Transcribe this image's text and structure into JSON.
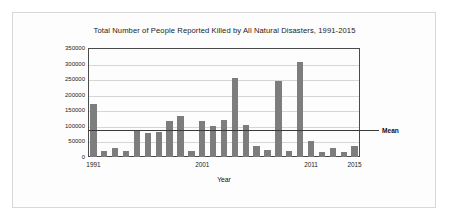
{
  "chart_data": {
    "type": "bar",
    "title": "Total Number of People Reported Killed by All Natural Disasters, 1991-2015",
    "xlabel": "Year",
    "ylabel": "Number of Deaths",
    "ylim": [
      0,
      350000
    ],
    "ytick_values": [
      0,
      50000,
      100000,
      150000,
      200000,
      250000,
      300000,
      350000
    ],
    "ytick_labels": [
      "0",
      "50000",
      "100000",
      "150000",
      "200000",
      "250000",
      "300000",
      "350000"
    ],
    "grid": true,
    "legend": "none",
    "xtick_labels": [
      "1991",
      "2001",
      "2011",
      "2015"
    ],
    "xtick_categories": [
      "1991",
      "2001",
      "2011",
      "2015"
    ],
    "categories": [
      "1991",
      "1992",
      "1993",
      "1994",
      "1995",
      "1996",
      "1997",
      "1998",
      "1999",
      "2000",
      "2001",
      "2002",
      "2003",
      "2004",
      "2005",
      "2006",
      "2007",
      "2008",
      "2009",
      "2010",
      "2011",
      "2012",
      "2013",
      "2014",
      "2015"
    ],
    "values": [
      170000,
      19000,
      29000,
      18000,
      84000,
      77000,
      79000,
      117000,
      132000,
      18000,
      117000,
      101000,
      120000,
      253000,
      102000,
      35000,
      24000,
      244000,
      18000,
      306000,
      51000,
      16000,
      30000,
      16000,
      34000
    ],
    "annotations": [
      {
        "label": "Mean",
        "type": "hline",
        "value": 88000
      }
    ],
    "mean_value": 88000,
    "bar_color": "#7d7d7d",
    "mean_line_color": "#3a3a3a",
    "grid_color": "#d6d6d6",
    "axis_color": "#4a4a4a"
  }
}
